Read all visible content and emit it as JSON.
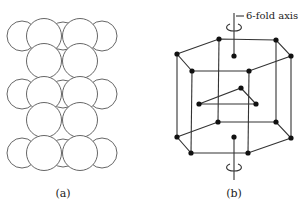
{
  "figure": {
    "panel_a": {
      "caption": "(a)",
      "description": "Close-packed layers of spheres (side view)"
    },
    "panel_b": {
      "caption": "(b)",
      "axis_label": "6-fold axis",
      "description": "Hexagonal close-packed unit cell with 6-fold rotation axis"
    }
  },
  "colors": {
    "line": "#4a4a4a",
    "atom": "#111111",
    "background": "#ffffff"
  }
}
